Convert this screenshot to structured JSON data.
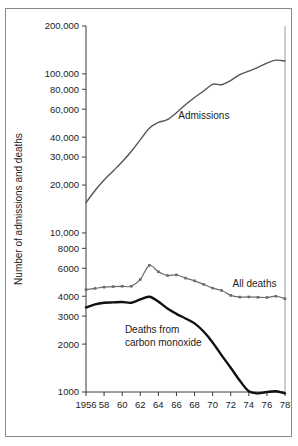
{
  "figure": {
    "ylabel": "Number of admissions and deaths",
    "frame_color": "#8a8a8a"
  },
  "chart_data": {
    "type": "line",
    "title": "",
    "xlabel": "",
    "ylabel": "Number of admissions and deaths",
    "yscale": "log",
    "ylim": [
      1000,
      200000
    ],
    "xlim": [
      1956,
      1978
    ],
    "grid": false,
    "legend": "inline-annotations",
    "x": [
      1956,
      1957,
      1958,
      1959,
      1960,
      1961,
      1962,
      1963,
      1964,
      1965,
      1966,
      1967,
      1968,
      1969,
      1970,
      1971,
      1972,
      1973,
      1974,
      1975,
      1976,
      1977,
      1978
    ],
    "ytick_values": [
      1000,
      2000,
      3000,
      4000,
      6000,
      8000,
      10000,
      20000,
      30000,
      40000,
      60000,
      80000,
      100000,
      200000
    ],
    "ytick_labels": [
      "1000",
      "2000",
      "3000",
      "4000",
      "6000",
      "8000",
      "10,000",
      "20,000",
      "30,000",
      "40,000",
      "60,000",
      "80,000",
      "100,000",
      "200,000"
    ],
    "xtick_values": [
      1956,
      1958,
      1960,
      1962,
      1964,
      1966,
      1968,
      1970,
      1972,
      1974,
      1976,
      1978
    ],
    "xtick_labels": [
      "1956",
      "58",
      "60",
      "62",
      "64",
      "66",
      "68",
      "70",
      "72",
      "74",
      "76",
      "78"
    ],
    "series": [
      {
        "name": "Admissions",
        "label": "Admissions",
        "color": "#555555",
        "linewidth": 1.4,
        "marker": "none",
        "label_x": 1966.2,
        "label_y": 52000,
        "values": [
          15500,
          18500,
          21500,
          24500,
          28000,
          32500,
          38500,
          45500,
          49500,
          51500,
          57000,
          64000,
          71000,
          78000,
          86000,
          85500,
          91000,
          99000,
          104000,
          110000,
          117000,
          122000,
          120500
        ]
      },
      {
        "name": "All deaths",
        "label": "All deaths",
        "color": "#6b6b6b",
        "linewidth": 1.2,
        "marker": "square",
        "label_x": 1972.2,
        "label_y": 4600,
        "values": [
          4400,
          4480,
          4560,
          4600,
          4620,
          4620,
          5100,
          6250,
          5700,
          5400,
          5450,
          5200,
          5000,
          4750,
          4500,
          4350,
          4050,
          3950,
          3960,
          3940,
          3930,
          4000,
          3860
        ]
      },
      {
        "name": "Deaths from carbon monoxide",
        "label": "Deaths from\ncarbon monoxide",
        "label_line1": "Deaths from",
        "label_line2": "carbon monoxide",
        "color": "#111111",
        "linewidth": 2.4,
        "marker": "none",
        "label_x": 1960.3,
        "label_y": 2350,
        "values": [
          3400,
          3560,
          3640,
          3660,
          3680,
          3640,
          3820,
          3970,
          3700,
          3350,
          3100,
          2900,
          2700,
          2400,
          2050,
          1700,
          1420,
          1180,
          1010,
          980,
          1000,
          1010,
          980
        ]
      }
    ]
  }
}
